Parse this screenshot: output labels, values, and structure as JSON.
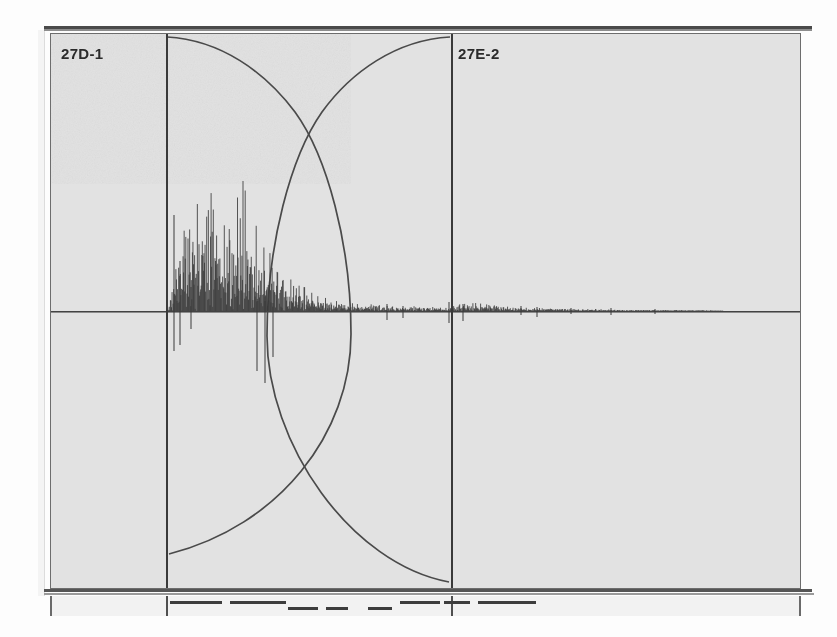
{
  "record": {
    "kind": "seismogram-scan",
    "background_color": "#e2e2e2",
    "ink_color": "#3a3a3a",
    "paper_color": "#fdfdfd"
  },
  "labels": {
    "left_trace": "27D-1",
    "right_trace": "27E-2"
  },
  "panel": {
    "x": 50,
    "y": 33,
    "width": 751,
    "height": 556,
    "baseline_y": 277
  },
  "phase_lines": [
    {
      "name": "phase-line-left",
      "x": 115
    },
    {
      "name": "phase-line-right",
      "x": 400
    }
  ],
  "arcs": [
    {
      "name": "arc-descending",
      "start": {
        "x": 115,
        "y": 3
      },
      "cross": {
        "x": 257,
        "y": 85
      },
      "end": {
        "x": 118,
        "y": 520
      }
    },
    {
      "name": "arc-ascending",
      "start": {
        "x": 400,
        "y": 3
      },
      "cross": {
        "x": 257,
        "y": 85
      },
      "end": {
        "x": 398,
        "y": 548
      }
    }
  ],
  "chart_data": {
    "type": "line",
    "title": "",
    "xlabel": "",
    "ylabel": "",
    "grid": false,
    "legend": "none",
    "xlim": [
      0,
      751
    ],
    "ylim": [
      -278,
      278
    ],
    "series": [
      {
        "name": "seismic-trace",
        "description": "seismogram amplitude envelope, emergent onset then exponential coda decay",
        "onset_x": 118,
        "peak_x": 175,
        "envelope_x": [
          115,
          120,
          126,
          132,
          138,
          144,
          150,
          156,
          162,
          168,
          174,
          180,
          186,
          192,
          198,
          204,
          210,
          216,
          222,
          228,
          234,
          240,
          248,
          256,
          264,
          272,
          280,
          290,
          300,
          312,
          324,
          336,
          348,
          360,
          372,
          384,
          396,
          410,
          425,
          440,
          460,
          480,
          500,
          520,
          545,
          570,
          600,
          640,
          690,
          751
        ],
        "envelope_upper": [
          0,
          14,
          42,
          70,
          86,
          74,
          96,
          118,
          86,
          70,
          58,
          52,
          62,
          74,
          52,
          44,
          38,
          34,
          30,
          26,
          22,
          18,
          15,
          12,
          10,
          8,
          7,
          6,
          5,
          4,
          5,
          4,
          3,
          4,
          3,
          3,
          2,
          5,
          6,
          5,
          3,
          2,
          2,
          2,
          1,
          1,
          1,
          1,
          0,
          0
        ],
        "envelope_lower": [
          0,
          16,
          48,
          82,
          104,
          96,
          124,
          142,
          124,
          116,
          108,
          96,
          112,
          130,
          104,
          88,
          74,
          66,
          58,
          50,
          44,
          36,
          28,
          22,
          17,
          14,
          11,
          9,
          8,
          6,
          7,
          5,
          4,
          5,
          4,
          4,
          3,
          7,
          8,
          6,
          4,
          3,
          3,
          2,
          2,
          1,
          1,
          1,
          0,
          0
        ]
      }
    ],
    "annotations": [
      {
        "text": "27D-1",
        "x": 10,
        "y": 11
      },
      {
        "text": "27E-2",
        "x": 407,
        "y": 11
      }
    ]
  },
  "timing_strip": {
    "name": "timing-scale",
    "ticks_x": [
      115,
      400
    ],
    "dashes": [
      {
        "x": 118,
        "width": 52,
        "row": 0
      },
      {
        "x": 178,
        "width": 56,
        "row": 0
      },
      {
        "x": 236,
        "width": 30,
        "row": 1
      },
      {
        "x": 274,
        "width": 22,
        "row": 1
      },
      {
        "x": 316,
        "width": 24,
        "row": 1
      },
      {
        "x": 348,
        "width": 40,
        "row": 0
      },
      {
        "x": 392,
        "width": 26,
        "row": 0
      },
      {
        "x": 426,
        "width": 58,
        "row": 0
      }
    ]
  }
}
